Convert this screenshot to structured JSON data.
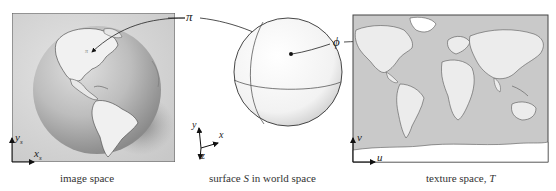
{
  "figure": {
    "panels": [
      {
        "id": "image-space",
        "caption": "image space",
        "axes": {
          "x": "x",
          "x_sub": "s",
          "y": "y",
          "y_sub": "s"
        }
      },
      {
        "id": "world-space",
        "caption_prefix": "surface ",
        "caption_var": "S",
        "caption_suffix": " in world space",
        "axes": {
          "x": "x",
          "y": "y",
          "z": "z"
        }
      },
      {
        "id": "texture-space",
        "caption_prefix": "texture space, ",
        "caption_var": "T",
        "axes": {
          "u": "u",
          "v": "v"
        }
      }
    ],
    "mappings": {
      "pi": "π",
      "phi": "ϕ"
    }
  }
}
